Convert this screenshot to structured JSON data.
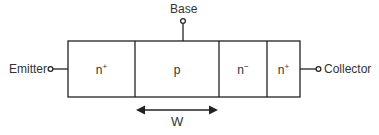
{
  "diagram": {
    "type": "npn-bipolar-transistor-structure",
    "terminals": {
      "emitter": "Emitter",
      "base": "Base",
      "collector": "Collector"
    },
    "regions": [
      {
        "base": "n",
        "sup": "+"
      },
      {
        "base": "p",
        "sup": ""
      },
      {
        "base": "n",
        "sup": "−"
      },
      {
        "base": "n",
        "sup": "+"
      }
    ],
    "dimension": {
      "label": "W",
      "spans": "p"
    },
    "colors": {
      "stroke": "#222222",
      "text": "#333333",
      "background": "#ffffff"
    }
  }
}
